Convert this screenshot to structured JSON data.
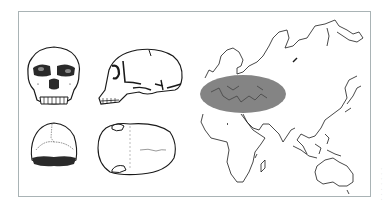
{
  "figure": {
    "panels": [
      {
        "id": "skull-frontal",
        "label": "Skull, frontal view"
      },
      {
        "id": "skull-lateral",
        "label": "Skull, lateral view"
      },
      {
        "id": "skull-posterior",
        "label": "Skull, posterior view"
      },
      {
        "id": "skull-superior",
        "label": "Skull, superior view"
      },
      {
        "id": "distribution-map",
        "label": "Map of Africa, Europe, Asia and Australia with shaded range"
      }
    ],
    "map": {
      "highlight_region": "Europe and Mediterranean / Near East",
      "highlight_color": "#7a7a7a"
    },
    "colors": {
      "frame_border": "#a9b3b5",
      "ink": "#1a1a1a",
      "background": "#ffffff"
    },
    "side_caption": "· · · · · · ·"
  }
}
